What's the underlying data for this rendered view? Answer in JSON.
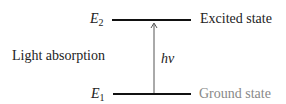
{
  "diagram": {
    "type": "energy-level-diagram",
    "levels": [
      {
        "symbol": "E",
        "subscript": "2",
        "name": "Excited state",
        "color": "#222222"
      },
      {
        "symbol": "E",
        "subscript": "1",
        "name": "Ground state",
        "color": "#888888"
      }
    ],
    "process_label": "Light absorption",
    "transition_label": "hν",
    "transition_direction": "up"
  }
}
